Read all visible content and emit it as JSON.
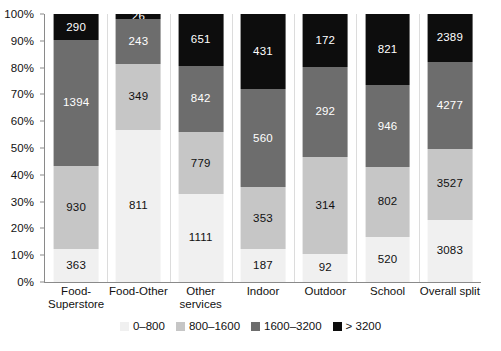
{
  "chart_data": {
    "type": "bar",
    "variant": "stacked-100-percent",
    "title": "",
    "xlabel": "",
    "ylabel": "",
    "ylim": [
      0,
      100
    ],
    "ytick_labels": [
      "0%",
      "10%",
      "20%",
      "30%",
      "40%",
      "50%",
      "60%",
      "70%",
      "80%",
      "90%",
      "100%"
    ],
    "ytick_values": [
      0,
      10,
      20,
      30,
      40,
      50,
      60,
      70,
      80,
      90,
      100
    ],
    "grid": false,
    "legend_position": "bottom-center",
    "categories": [
      "Food-Superstore",
      "Food-Other",
      "Other services",
      "Indoor",
      "Outdoor",
      "School",
      "Overall split"
    ],
    "category_label_lines": [
      [
        "Food-",
        "Superstore"
      ],
      [
        "Food-Other",
        ""
      ],
      [
        "Other",
        "services"
      ],
      [
        "Indoor",
        ""
      ],
      [
        "Outdoor",
        ""
      ],
      [
        "School",
        ""
      ],
      [
        "Overall split",
        ""
      ]
    ],
    "series": [
      {
        "name": "0–800",
        "color": "#f0f0f0",
        "values": [
          363,
          811,
          1111,
          187,
          92,
          520,
          3083
        ],
        "percents": [
          12.2,
          56.8,
          32.8,
          12.2,
          10.6,
          16.8,
          23.2
        ]
      },
      {
        "name": "800–1600",
        "color": "#c6c6c6",
        "values": [
          930,
          349,
          779,
          353,
          314,
          802,
          3527
        ],
        "percents": [
          31.2,
          24.4,
          23.0,
          23.1,
          36.1,
          26.0,
          26.6
        ]
      },
      {
        "name": "1600–3200",
        "color": "#6d6d6d",
        "values": [
          1394,
          243,
          842,
          560,
          292,
          946,
          4277
        ],
        "percents": [
          46.8,
          17.0,
          24.9,
          36.6,
          33.6,
          30.6,
          32.2
        ]
      },
      {
        "name": "> 3200",
        "color": "#0d0d0d",
        "values": [
          290,
          26,
          651,
          431,
          172,
          821,
          2389
        ],
        "percents": [
          9.7,
          1.8,
          19.2,
          28.2,
          19.8,
          26.6,
          18.0
        ]
      }
    ],
    "totals": [
      2977,
      1429,
      3383,
      1531,
      870,
      3089,
      13276
    ]
  },
  "legend": {
    "items": [
      {
        "label": "0–800",
        "swatch": "s0"
      },
      {
        "label": "800–1600",
        "swatch": "s1"
      },
      {
        "label": "1600–3200",
        "swatch": "s2"
      },
      {
        "label": "> 3200",
        "swatch": "s3"
      }
    ]
  },
  "caption": {
    "text": ""
  }
}
